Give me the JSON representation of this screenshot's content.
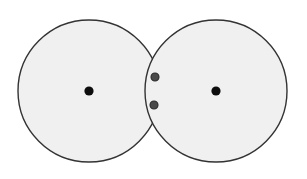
{
  "canvas": {
    "width": 307,
    "height": 179,
    "background_color": "#ffffff"
  },
  "figure": {
    "name": "two-intersecting-circles",
    "fill_color": "#f0f0f0",
    "stroke_color": "#333333",
    "stroke_width": 1.4
  },
  "circles": [
    {
      "id": "left-circle",
      "label": "Left circle",
      "cx": 89,
      "cy": 91,
      "r": 71,
      "fill": "#f0f0f0",
      "stroke": "#333333"
    },
    {
      "id": "right-circle",
      "label": "Right circle",
      "cx": 216,
      "cy": 91,
      "r": 71,
      "fill": "#f0f0f0",
      "stroke": "#333333"
    }
  ],
  "center_points": [
    {
      "id": "left-center-point",
      "label": "Left circle center",
      "cx": 89,
      "cy": 91,
      "r": 4.6,
      "fill": "#0d0d0d"
    },
    {
      "id": "right-center-point",
      "label": "Right circle center",
      "cx": 216,
      "cy": 91,
      "r": 4.6,
      "fill": "#0d0d0d"
    }
  ],
  "lens_points": [
    {
      "id": "lens-point-upper",
      "label": "Upper point in intersection",
      "cx": 155,
      "cy": 77,
      "r": 4.0,
      "fill": "#4a4a4a",
      "stroke": "#2b2b2b"
    },
    {
      "id": "lens-point-lower",
      "label": "Lower point in intersection",
      "cx": 154,
      "cy": 105,
      "r": 4.0,
      "fill": "#4a4a4a",
      "stroke": "#2b2b2b"
    }
  ],
  "intersection": {
    "id": "lens-region",
    "label": "Lens-shaped intersection region",
    "top_vertex": {
      "x": 152,
      "y": 46
    },
    "bottom_vertex": {
      "x": 152,
      "y": 136
    }
  }
}
